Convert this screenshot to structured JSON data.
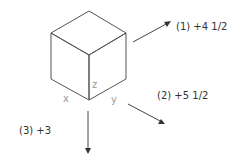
{
  "cube": {
    "axis_labels": {
      "x": "x",
      "y": "y",
      "z": "z"
    }
  },
  "arrows": [
    {
      "id": 1,
      "label": "(1) +4 1/2",
      "direction": "up-right"
    },
    {
      "id": 2,
      "label": "(2) +5 1/2",
      "direction": "down-right"
    },
    {
      "id": 3,
      "label": "(3) +3",
      "direction": "down"
    }
  ],
  "colors": {
    "line": "#444444",
    "axis_text": "#999999",
    "text": "#333333"
  }
}
